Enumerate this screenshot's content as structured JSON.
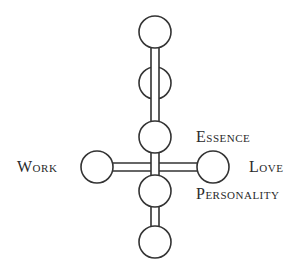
{
  "diagram": {
    "type": "node-cross diagram",
    "stroke_color": "#333333",
    "fill_color": "#ffffff",
    "labels": {
      "essence": "Essence",
      "love": "Love",
      "personality": "Personality",
      "work": "Work"
    },
    "nodes": [
      {
        "id": "top",
        "cx": 155,
        "cy": 32,
        "r": 16
      },
      {
        "id": "upper-middle",
        "cx": 155,
        "cy": 83,
        "r": 16
      },
      {
        "id": "essence",
        "cx": 155,
        "cy": 137,
        "r": 16
      },
      {
        "id": "work",
        "cx": 97,
        "cy": 167,
        "r": 16
      },
      {
        "id": "love",
        "cx": 213,
        "cy": 167,
        "r": 16
      },
      {
        "id": "personality",
        "cx": 155,
        "cy": 191,
        "r": 16
      },
      {
        "id": "bottom",
        "cx": 155,
        "cy": 242,
        "r": 16
      }
    ],
    "connectors": [
      {
        "from": "top",
        "to": "essence",
        "style": "double-line"
      },
      {
        "from": "essence",
        "to": "personality",
        "style": "double-line"
      },
      {
        "from": "work",
        "to": "love",
        "style": "double-line"
      },
      {
        "from": "personality",
        "to": "bottom",
        "style": "double-line"
      }
    ]
  }
}
